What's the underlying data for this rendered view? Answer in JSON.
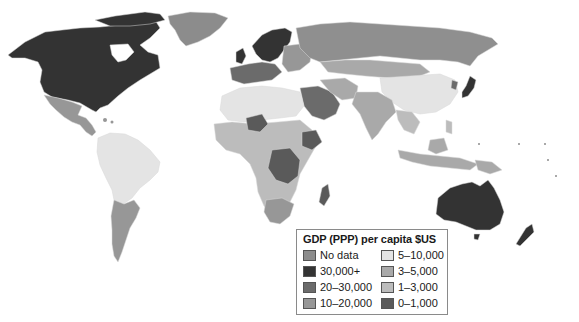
{
  "legend": {
    "title": "GDP (PPP) per capita $US",
    "items": [
      {
        "label": "No data",
        "color": "#8c8c8c"
      },
      {
        "label": "5–10,000",
        "color": "#e4e4e4"
      },
      {
        "label": "30,000+",
        "color": "#333333"
      },
      {
        "label": "3–5,000",
        "color": "#a9a9a9"
      },
      {
        "label": "20–30,000",
        "color": "#6b6b6b"
      },
      {
        "label": "1–3,000",
        "color": "#bcbcbc"
      },
      {
        "label": "10–20,000",
        "color": "#979797"
      },
      {
        "label": "0–1,000",
        "color": "#5a5a5a"
      }
    ]
  },
  "map": {
    "title": "World GDP (PPP) per capita choropleth",
    "regions": [
      {
        "name": "North America (USA/Canada)",
        "category": "30,000+"
      },
      {
        "name": "Greenland",
        "category": "10–20,000"
      },
      {
        "name": "Mexico / Central America",
        "category": "10–20,000"
      },
      {
        "name": "South America (north/Brazil)",
        "category": "5–10,000"
      },
      {
        "name": "Argentina / Chile",
        "category": "10–20,000"
      },
      {
        "name": "Western Europe",
        "category": "30,000+"
      },
      {
        "name": "Eastern Europe",
        "category": "10–20,000"
      },
      {
        "name": "Russia",
        "category": "10–20,000"
      },
      {
        "name": "China",
        "category": "5–10,000"
      },
      {
        "name": "Japan",
        "category": "30,000+"
      },
      {
        "name": "India / South Asia",
        "category": "3–5,000"
      },
      {
        "name": "Middle East",
        "category": "20–30,000"
      },
      {
        "name": "North Africa",
        "category": "5–10,000"
      },
      {
        "name": "Sub-Saharan Africa",
        "category": "1–3,000"
      },
      {
        "name": "Central Africa",
        "category": "0–1,000"
      },
      {
        "name": "Australia",
        "category": "30,000+"
      },
      {
        "name": "Southeast Asia",
        "category": "3–5,000"
      }
    ]
  }
}
